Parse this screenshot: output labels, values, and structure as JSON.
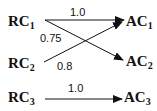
{
  "diagram": {
    "left_nodes": [
      {
        "id": "RC1",
        "base": "RC",
        "sub": "1"
      },
      {
        "id": "RC2",
        "base": "RC",
        "sub": "2"
      },
      {
        "id": "RC3",
        "base": "RC",
        "sub": "3"
      }
    ],
    "right_nodes": [
      {
        "id": "AC1",
        "base": "AC",
        "sub": "1"
      },
      {
        "id": "AC2",
        "base": "AC",
        "sub": "2"
      },
      {
        "id": "AC3",
        "base": "AC",
        "sub": "3"
      }
    ],
    "edges": [
      {
        "from": "RC1",
        "to": "AC1",
        "weight": "1.0"
      },
      {
        "from": "RC1",
        "to": "AC2",
        "weight": "0.75"
      },
      {
        "from": "RC2",
        "to": "AC1",
        "weight": "0.8"
      },
      {
        "from": "RC3",
        "to": "AC3",
        "weight": "1.0"
      }
    ]
  }
}
